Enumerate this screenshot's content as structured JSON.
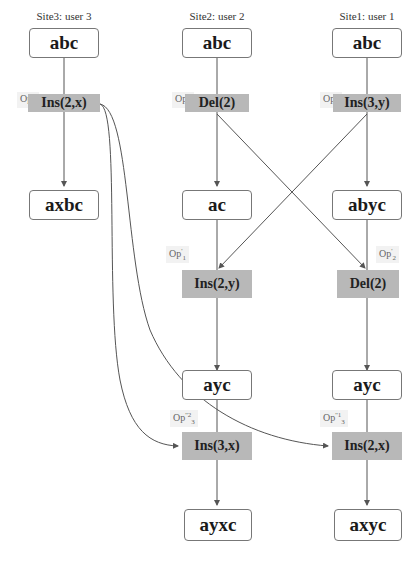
{
  "sites": [
    {
      "label": "Site3: user 3",
      "x": 64
    },
    {
      "label": "Site2: user 2",
      "x": 217
    },
    {
      "label": "Site1: user 1",
      "x": 367
    }
  ],
  "states": {
    "s3_initial": "abc",
    "s2_initial": "abc",
    "s1_initial": "abc",
    "s3_after_op3": "axbc",
    "s2_after_op2": "ac",
    "s1_after_op1": "abyc",
    "s2_after_op1t": "ayc",
    "s1_after_op2t": "ayc",
    "s2_final": "ayxc",
    "s1_final": "axyc"
  },
  "operations": {
    "op3": {
      "tag": "Op",
      "sub": "3",
      "sup": "",
      "label": "Ins(2,x)"
    },
    "op2": {
      "tag": "Op",
      "sub": "2",
      "sup": "",
      "label": "Del(2)"
    },
    "op1": {
      "tag": "Op",
      "sub": "1",
      "sup": "",
      "label": "Ins(3,y)"
    },
    "op1t": {
      "tag": "Op",
      "sup": "'",
      "sub": "1",
      "label": "Ins(2,y)"
    },
    "op2t": {
      "tag": "Op",
      "sup": "'",
      "sub": "2",
      "label": "Del(2)"
    },
    "op3t_site2": {
      "tag": "Op",
      "sup": "''2",
      "sub": "3",
      "label": "Ins(3,x)"
    },
    "op3t_site1": {
      "tag": "Op",
      "sup": "''1",
      "sub": "3",
      "label": "Ins(2,x)"
    }
  },
  "colors": {
    "op_fill": "#b8b8b8",
    "edge": "#555555",
    "state_border": "#777777"
  }
}
